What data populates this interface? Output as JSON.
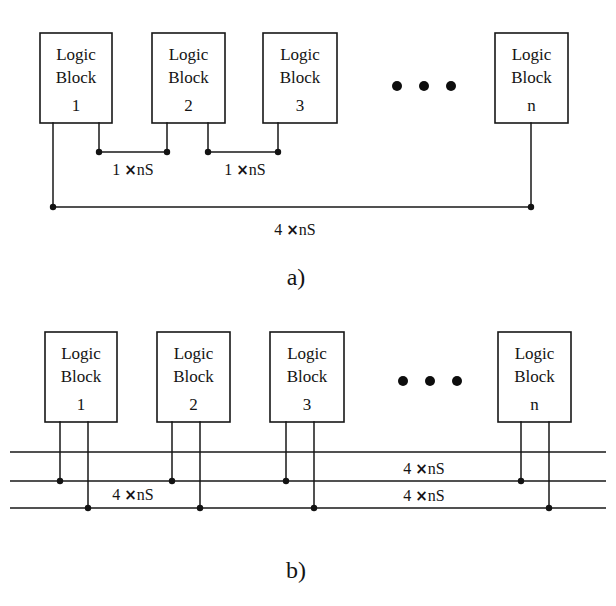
{
  "figure": {
    "background_color": "#ffffff",
    "line_color": "#171717",
    "text_color": "#141414"
  },
  "panels": [
    {
      "id": "a",
      "caption": "a)",
      "caption_pos": {
        "x": 296,
        "y": 285
      },
      "blocks": [
        {
          "line1": "Logic",
          "line2": "Block",
          "index": "1",
          "x": 40,
          "y": 33,
          "w": 72,
          "h": 90,
          "pins": [
            "left",
            "right"
          ]
        },
        {
          "line1": "Logic",
          "line2": "Block",
          "index": "2",
          "x": 152,
          "y": 33,
          "w": 73,
          "h": 90,
          "pins": [
            "left",
            "right"
          ]
        },
        {
          "line1": "Logic",
          "line2": "Block",
          "index": "3",
          "x": 263,
          "y": 33,
          "w": 74,
          "h": 90,
          "pins": [
            "left",
            "right"
          ]
        },
        {
          "line1": "Logic",
          "line2": "Block",
          "index": "n",
          "x": 495,
          "y": 33,
          "w": 73,
          "h": 90,
          "pins": [
            "center"
          ]
        }
      ],
      "ellipsis": {
        "cx": [
          397,
          424,
          451
        ],
        "cy": 86,
        "r": 5.0
      },
      "segments": [
        {
          "name": "segment-1-2",
          "y": 152,
          "x1": 99,
          "x2": 167,
          "label": "1 ×nS",
          "label_coeff": "1",
          "label_unit": "nS",
          "label_pos": {
            "x": 133,
            "y": 175
          }
        },
        {
          "name": "segment-2-3",
          "y": 152,
          "x1": 208,
          "x2": 278,
          "label": "1 ×nS",
          "label_coeff": "1",
          "label_unit": "nS",
          "label_pos": {
            "x": 245,
            "y": 175
          }
        }
      ],
      "long_bus": {
        "name": "global-bus",
        "y": 207,
        "x1": 53,
        "x2": 531,
        "label": "4 ×nS",
        "label_coeff": "4",
        "label_unit": "nS",
        "label_pos": {
          "x": 295,
          "y": 235
        }
      }
    },
    {
      "id": "b",
      "caption": "b)",
      "caption_pos": {
        "x": 296,
        "y": 578
      },
      "blocks": [
        {
          "line1": "Logic",
          "line2": "Block",
          "index": "1",
          "x": 45,
          "y": 332,
          "w": 72,
          "h": 90,
          "pins": [
            "left",
            "right"
          ]
        },
        {
          "line1": "Logic",
          "line2": "Block",
          "index": "2",
          "x": 157,
          "y": 332,
          "w": 73,
          "h": 90,
          "pins": [
            "left",
            "right"
          ]
        },
        {
          "line1": "Logic",
          "line2": "Block",
          "index": "3",
          "x": 270,
          "y": 332,
          "w": 74,
          "h": 90,
          "pins": [
            "left",
            "right"
          ]
        },
        {
          "line1": "Logic",
          "line2": "Block",
          "index": "n",
          "x": 498,
          "y": 332,
          "w": 73,
          "h": 90,
          "pins": [
            "left",
            "right"
          ]
        }
      ],
      "ellipsis": {
        "cx": [
          403,
          430,
          457
        ],
        "cy": 381,
        "r": 5.0
      },
      "bus_lines": [
        {
          "name": "bus-line-top",
          "y": 452,
          "x1": 10,
          "x2": 606
        },
        {
          "name": "bus-line-middle",
          "y": 481,
          "x1": 10,
          "x2": 606
        },
        {
          "name": "bus-line-bottom",
          "y": 508,
          "x1": 10,
          "x2": 606
        }
      ],
      "labels": [
        {
          "name": "bus-label-left-bottom",
          "text": "4 ×nS",
          "coeff": "4",
          "unit": "nS",
          "x": 133,
          "y": 499
        },
        {
          "name": "bus-label-right-middle",
          "text": "4 ×nS",
          "coeff": "4",
          "unit": "nS",
          "x": 424,
          "y": 473
        },
        {
          "name": "bus-label-right-bottom",
          "text": "4 ×nS",
          "coeff": "4",
          "unit": "nS",
          "x": 424,
          "y": 500
        }
      ]
    }
  ],
  "symbols": {
    "multiply": "×",
    "ellipsis_dot": "dot",
    "junction": "junction-dot"
  }
}
